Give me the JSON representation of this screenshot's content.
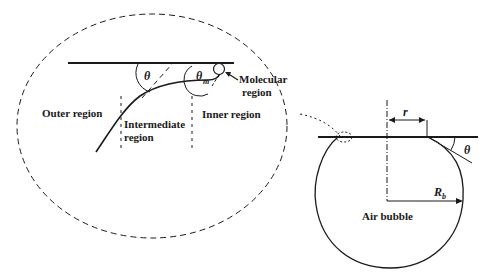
{
  "diagram": {
    "inset": {
      "labels": {
        "outer_region": "Outer region",
        "intermediate_region_line1": "Intermediate",
        "intermediate_region_line2": "region",
        "inner_region": "Inner region",
        "molecular_region_line1": "Molecular",
        "molecular_region_line2": "region"
      },
      "symbols": {
        "theta": "θ",
        "theta_m": "θ",
        "theta_m_sub": "m"
      }
    },
    "bubble": {
      "labels": {
        "air_bubble": "Air bubble",
        "radius_symbol": "R",
        "radius_sub": "b",
        "contact_radius": "r",
        "theta": "θ"
      }
    },
    "colors": {
      "stroke": "#1a1a1a",
      "background": "#ffffff"
    }
  }
}
